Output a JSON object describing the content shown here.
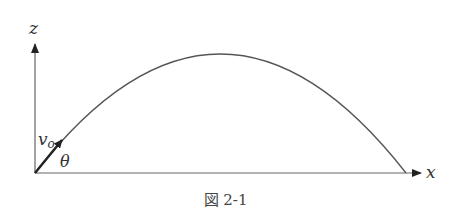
{
  "figure": {
    "caption": "図 2-1",
    "labels": {
      "z_axis": "z",
      "x_axis": "x",
      "velocity": "v",
      "velocity_sub": "o",
      "angle": "θ"
    },
    "colors": {
      "line": "#555555",
      "arrow": "#222222",
      "text": "#333333"
    }
  }
}
